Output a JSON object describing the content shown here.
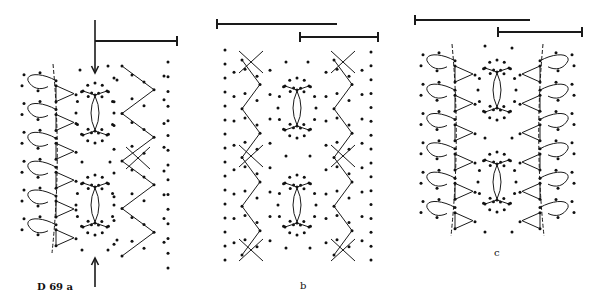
{
  "figure": {
    "colors": {
      "ink": "#111111",
      "background": "#ffffff"
    },
    "panels": [
      {
        "id": "a",
        "label": "D 69 a",
        "edge_left": "picot-footside",
        "edge_right": "torchon-zigzag",
        "has_arrows": true,
        "repeats": 2
      },
      {
        "id": "b",
        "label": "b",
        "edge_left": "torchon-zigzag",
        "edge_right": "torchon-zigzag",
        "has_arrows": false,
        "repeats": 2
      },
      {
        "id": "c",
        "label": "c",
        "edge_left": "picot-footside",
        "edge_right": "picot-footside",
        "has_arrows": false,
        "repeats": 2
      }
    ],
    "scale_bars": [
      {
        "panel": "a",
        "count": 1
      },
      {
        "panel": "b",
        "count": 2
      },
      {
        "panel": "c",
        "count": 2
      }
    ]
  }
}
